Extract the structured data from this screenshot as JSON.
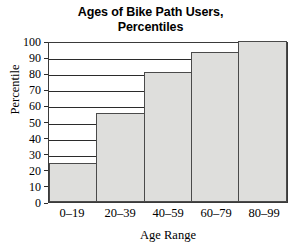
{
  "chart_data": {
    "type": "bar",
    "title": "Ages of Bike Path Users, Percentiles",
    "title_lines": [
      "Ages of Bike Path Users,",
      "Percentiles"
    ],
    "categories": [
      "0–19",
      "20–39",
      "40–59",
      "60–79",
      "80–99"
    ],
    "values": [
      24,
      55,
      81,
      93,
      100
    ],
    "xlabel": "Age Range",
    "ylabel": "Percentile",
    "ylim": [
      0,
      100
    ],
    "ytick_labels": [
      "100",
      "90",
      "80",
      "70",
      "60",
      "50",
      "40",
      "30",
      "20",
      "10",
      "0"
    ],
    "ytick_values": [
      100,
      90,
      80,
      70,
      60,
      50,
      40,
      30,
      20,
      10,
      0
    ],
    "grid": "horizontal",
    "legend": "none",
    "bar_fill_color": "#dededc",
    "bar_border_color": "#4a4a4a",
    "axis_color": "#2b2b2b"
  }
}
